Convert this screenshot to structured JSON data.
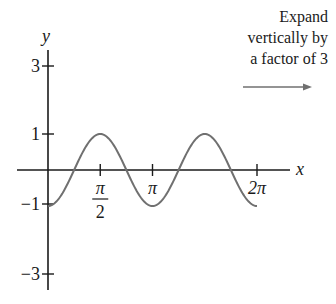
{
  "annotation": {
    "lines": [
      "Expand",
      "vertically by",
      "a factor of 3"
    ],
    "arrow": "right-arrow"
  },
  "axes": {
    "x_label": "x",
    "y_label": "y",
    "x_ticks": [
      "π/2",
      "π",
      "2π"
    ],
    "y_ticks": [
      "3",
      "1",
      "−1",
      "−3"
    ]
  },
  "colors": {
    "axis": "#1a1a1a",
    "curve": "#707070",
    "arrow": "#707070"
  },
  "chart_data": {
    "type": "line",
    "title": "",
    "function": "y = -cos(2x)",
    "xlabel": "x",
    "ylabel": "y",
    "xlim": [
      -0.9,
      7.3
    ],
    "ylim": [
      -3.3,
      3.4
    ],
    "x_tick_labels": [
      "π/2",
      "π",
      "2π"
    ],
    "x_tick_values": [
      1.5708,
      3.1416,
      6.2832
    ],
    "y_tick_values": [
      -3,
      -1,
      1,
      3
    ],
    "series": [
      {
        "name": "y = -cos(2x)",
        "x": [
          0,
          0.3927,
          0.7854,
          1.1781,
          1.5708,
          1.9635,
          2.3562,
          2.7489,
          3.1416,
          3.5343,
          3.927,
          4.3197,
          4.7124,
          5.1051,
          5.4978,
          5.8905,
          6.2832
        ],
        "values": [
          -1,
          -0.707,
          0,
          0.707,
          1,
          0.707,
          0,
          -0.707,
          -1,
          -0.707,
          0,
          0.707,
          1,
          0.707,
          0,
          -0.707,
          -1
        ]
      }
    ],
    "annotations": [
      "Expand vertically by a factor of 3"
    ],
    "grid": false,
    "legend": "none"
  }
}
